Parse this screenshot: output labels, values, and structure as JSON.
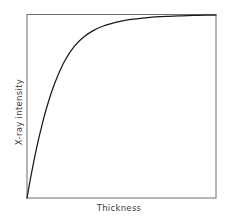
{
  "figure": {
    "background_color": "#ffffff",
    "frame_color": "#6e6e6e",
    "curve_color": "#1a1a1a",
    "label_color": "#3b3b3b"
  },
  "chart_data": {
    "type": "line",
    "title": "",
    "subtitle": "",
    "xlabel": "Thickness",
    "ylabel": "X-ray intensity",
    "grid": false,
    "legend": null,
    "axis_ticks": {
      "x": [],
      "y": []
    },
    "xlim": [
      0,
      1
    ],
    "ylim": [
      0,
      1
    ],
    "annotations": [],
    "series": [
      {
        "name": "X-ray intensity vs thickness",
        "description": "Exponential saturation curve rising steeply from the origin and flattening to a plateau",
        "x": [
          0.0,
          0.02,
          0.04,
          0.06,
          0.08,
          0.1,
          0.13,
          0.16,
          0.2,
          0.25,
          0.3,
          0.35,
          0.4,
          0.45,
          0.5,
          0.55,
          0.6,
          0.65,
          0.7,
          0.75,
          0.8,
          0.85,
          0.9,
          0.95,
          1.0
        ],
        "y": [
          0.0,
          0.115,
          0.22,
          0.315,
          0.4,
          0.478,
          0.578,
          0.66,
          0.748,
          0.826,
          0.877,
          0.912,
          0.936,
          0.952,
          0.964,
          0.973,
          0.979,
          0.984,
          0.988,
          0.99,
          0.992,
          0.994,
          0.995,
          0.996,
          0.997
        ]
      }
    ]
  }
}
